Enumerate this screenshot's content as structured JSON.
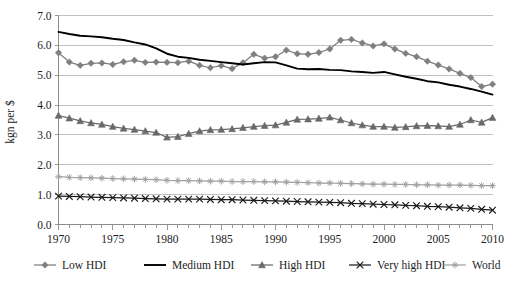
{
  "chart_data": {
    "type": "line",
    "title": "",
    "subtitle": "",
    "xlabel": "",
    "ylabel": "kgn per $",
    "xlim": [
      1970,
      2010
    ],
    "ylim": [
      0.0,
      7.0
    ],
    "grid": true,
    "legend_position": "bottom",
    "x_ticks_labeled": [
      "1970",
      "1975",
      "1980",
      "1985",
      "1990",
      "1995",
      "2000",
      "2005",
      "2010"
    ],
    "x_tick_values": [
      1970,
      1975,
      1980,
      1985,
      1990,
      1995,
      2000,
      2005,
      2010
    ],
    "y_ticks": [
      "0.0",
      "1.0",
      "2.0",
      "3.0",
      "4.0",
      "5.0",
      "6.0",
      "7.0"
    ],
    "y_tick_values": [
      0.0,
      1.0,
      2.0,
      3.0,
      4.0,
      5.0,
      6.0,
      7.0
    ],
    "x": [
      1970,
      1971,
      1972,
      1973,
      1974,
      1975,
      1976,
      1977,
      1978,
      1979,
      1980,
      1981,
      1982,
      1983,
      1984,
      1985,
      1986,
      1987,
      1988,
      1989,
      1990,
      1991,
      1992,
      1993,
      1994,
      1995,
      1996,
      1997,
      1998,
      1999,
      2000,
      2001,
      2002,
      2003,
      2004,
      2005,
      2006,
      2007,
      2008,
      2009,
      2010
    ],
    "series": [
      {
        "name": "Low HDI",
        "color": "#7f7f7f",
        "marker": "diamond",
        "values": [
          5.75,
          5.44,
          5.33,
          5.4,
          5.41,
          5.36,
          5.45,
          5.5,
          5.43,
          5.44,
          5.43,
          5.42,
          5.47,
          5.33,
          5.25,
          5.32,
          5.22,
          5.42,
          5.7,
          5.57,
          5.62,
          5.84,
          5.72,
          5.7,
          5.76,
          5.88,
          6.17,
          6.2,
          6.08,
          5.98,
          6.05,
          5.88,
          5.73,
          5.62,
          5.47,
          5.34,
          5.21,
          5.06,
          4.92,
          4.62,
          4.7
        ]
      },
      {
        "name": "Medium HDI",
        "color": "#000000",
        "marker": "none",
        "values": [
          6.45,
          6.38,
          6.32,
          6.3,
          6.27,
          6.22,
          6.18,
          6.1,
          6.03,
          5.9,
          5.72,
          5.62,
          5.58,
          5.52,
          5.48,
          5.44,
          5.4,
          5.36,
          5.4,
          5.44,
          5.43,
          5.33,
          5.22,
          5.2,
          5.21,
          5.18,
          5.17,
          5.13,
          5.11,
          5.08,
          5.11,
          5.03,
          4.95,
          4.88,
          4.8,
          4.76,
          4.68,
          4.62,
          4.54,
          4.45,
          4.35
        ]
      },
      {
        "name": "High HDI",
        "color": "#696969",
        "marker": "triangle",
        "values": [
          3.65,
          3.56,
          3.47,
          3.4,
          3.35,
          3.28,
          3.22,
          3.18,
          3.13,
          3.08,
          2.92,
          2.94,
          3.04,
          3.13,
          3.17,
          3.18,
          3.2,
          3.24,
          3.28,
          3.31,
          3.33,
          3.42,
          3.52,
          3.53,
          3.55,
          3.59,
          3.5,
          3.4,
          3.33,
          3.28,
          3.28,
          3.25,
          3.27,
          3.3,
          3.31,
          3.3,
          3.28,
          3.35,
          3.5,
          3.42,
          3.58
        ]
      },
      {
        "name": "Very high HDI",
        "color": "#1a1a1a",
        "marker": "cross-x",
        "values": [
          0.95,
          0.94,
          0.93,
          0.92,
          0.91,
          0.9,
          0.89,
          0.88,
          0.87,
          0.86,
          0.85,
          0.85,
          0.85,
          0.85,
          0.84,
          0.83,
          0.83,
          0.82,
          0.81,
          0.8,
          0.79,
          0.78,
          0.77,
          0.76,
          0.75,
          0.74,
          0.73,
          0.71,
          0.7,
          0.68,
          0.67,
          0.66,
          0.64,
          0.63,
          0.61,
          0.6,
          0.58,
          0.56,
          0.54,
          0.51,
          0.48
        ]
      },
      {
        "name": "World",
        "color": "#a0a0a0",
        "marker": "asterisk",
        "values": [
          1.6,
          1.58,
          1.57,
          1.56,
          1.55,
          1.54,
          1.53,
          1.52,
          1.51,
          1.5,
          1.48,
          1.47,
          1.47,
          1.46,
          1.45,
          1.45,
          1.44,
          1.44,
          1.44,
          1.43,
          1.43,
          1.42,
          1.41,
          1.4,
          1.39,
          1.39,
          1.38,
          1.37,
          1.36,
          1.35,
          1.35,
          1.34,
          1.34,
          1.33,
          1.33,
          1.32,
          1.32,
          1.32,
          1.31,
          1.3,
          1.3
        ]
      }
    ]
  },
  "legend": {
    "items": [
      {
        "label": "Low HDI"
      },
      {
        "label": "Medium HDI"
      },
      {
        "label": "High HDI"
      },
      {
        "label": "Very high HDI"
      },
      {
        "label": "World"
      }
    ]
  },
  "axis": {
    "y_title": "kgn per $"
  }
}
